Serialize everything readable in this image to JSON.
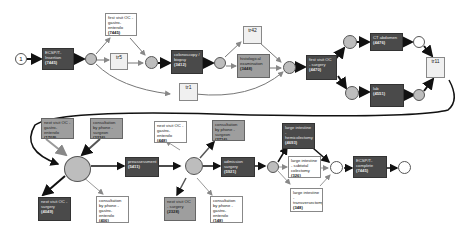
{
  "diagram": {
    "type": "petri-net-process-model",
    "start_place": {
      "label": "1"
    },
    "transitions": [
      {
        "id": "t_ecsp",
        "label": "ECSP/T-Insertion",
        "count": "(7445)",
        "style": "dark"
      },
      {
        "id": "t_fv_gastro",
        "label": "first visit OC - gastro-enterolo",
        "count": "(7445)",
        "style": "light"
      },
      {
        "id": "t_tr5",
        "label": "tr5",
        "count": "",
        "style": "tau"
      },
      {
        "id": "t_colonoscopy",
        "label": "colonoscopy / biopsy",
        "count": "(3412)",
        "style": "dark"
      },
      {
        "id": "t_tr42",
        "label": "tr42",
        "count": "",
        "style": "tau"
      },
      {
        "id": "t_histological",
        "label": "histological examination",
        "count": "(3448)",
        "style": "mid"
      },
      {
        "id": "t_tr1",
        "label": "tr1",
        "count": "",
        "style": "tau"
      },
      {
        "id": "t_fv_surgery",
        "label": "first visit OC - surgery",
        "count": "(4470)",
        "style": "dark"
      },
      {
        "id": "t_ct_abdomen",
        "label": "CT abdomen",
        "count": "(4476)",
        "style": "dark"
      },
      {
        "id": "t_lab",
        "label": "lab",
        "count": "(4551)",
        "style": "dark"
      },
      {
        "id": "t_tr11",
        "label": "tr11",
        "count": "",
        "style": "tau"
      },
      {
        "id": "t_nv_gastro_1",
        "label": "next visit OC - gastro-enterolo",
        "count": "(1709)",
        "style": "mid"
      },
      {
        "id": "t_phone_surgeon_1",
        "label": "consultation by phone - surgeon",
        "count": "(3226)",
        "style": "mid"
      },
      {
        "id": "t_nv_surgery_1",
        "label": "next visit OC - surgery",
        "count": "(4049)",
        "style": "dark"
      },
      {
        "id": "t_phone_gastro_1",
        "label": "consultation by phone - gastro-enterolo",
        "count": "(406)",
        "style": "light"
      },
      {
        "id": "t_preassessment",
        "label": "preassessment",
        "count": "(5411)",
        "style": "dark"
      },
      {
        "id": "t_nv_gastro_2",
        "label": "next visit OC - gastro-enterolo",
        "count": "(448)",
        "style": "light"
      },
      {
        "id": "t_phone_surgeon_2",
        "label": "consultation by phone - surgeon",
        "count": "(2716)",
        "style": "mid"
      },
      {
        "id": "t_nv_surgery_2",
        "label": "next visit OC - surgery",
        "count": "(2328)",
        "style": "mid"
      },
      {
        "id": "t_phone_gastro_2",
        "label": "consultation by phone - gastro-enterolo",
        "count": "(148)",
        "style": "light"
      },
      {
        "id": "t_admission",
        "label": "admission surgery",
        "count": "(5921)",
        "style": "dark"
      },
      {
        "id": "t_hemicolectomy",
        "label": "large intestine - hemicolectomy",
        "count": "(4693)",
        "style": "dark"
      },
      {
        "id": "t_subtotal",
        "label": "large intestine - subtotal colectomy",
        "count": "(326)",
        "style": "light"
      },
      {
        "id": "t_transverse",
        "label": "large intestine - transversectomy",
        "count": "(348)",
        "style": "light"
      },
      {
        "id": "t_discharge",
        "label": "ECSP/T-complete",
        "count": "(7445)",
        "style": "dark"
      }
    ],
    "colors": {
      "dark_transition": "#4a4a4a",
      "mid_transition": "#9e9e9e",
      "light_transition": "#ffffff",
      "place_fill": "#bdbdbd",
      "arc": "#111111",
      "light_arc": "#9a9a9a"
    }
  }
}
